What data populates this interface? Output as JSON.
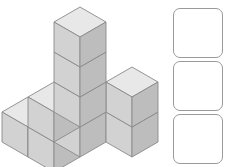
{
  "figure": {
    "name": "isometric-cube-stack",
    "cube_count": 9,
    "colors": {
      "top_face": "#e8e8e8",
      "left_face": "#d2d2d2",
      "right_face": "#bdbdbd",
      "outline": "#8a8a8a",
      "background": "#ffffff"
    },
    "projection": {
      "half_width": 26,
      "half_height": 15,
      "cube_height": 30,
      "origin_x": 80,
      "origin_y": 127
    },
    "cubes": [
      {
        "label": "bottom-left-back",
        "gx": -1,
        "gy": 1,
        "gz": 0
      },
      {
        "label": "bottom-left-front",
        "gx": -1,
        "gy": 0,
        "gz": 0
      },
      {
        "label": "bottom-center-back",
        "gx": 0,
        "gy": 1,
        "gz": 0
      },
      {
        "label": "bottom-center-front",
        "gx": 0,
        "gy": 0,
        "gz": 0
      },
      {
        "label": "bottom-right-back",
        "gx": 1,
        "gy": 1,
        "gz": 0
      },
      {
        "label": "bottom-right-front",
        "gx": 1,
        "gy": 0,
        "gz": 0
      },
      {
        "label": "middle-center",
        "gx": 0,
        "gy": 1,
        "gz": 1
      },
      {
        "label": "middle-right",
        "gx": 1,
        "gy": 1,
        "gz": 1
      },
      {
        "label": "top-center",
        "gx": 0,
        "gy": 1,
        "gz": 2
      }
    ]
  },
  "options": {
    "label": "answer-choices",
    "count": 3,
    "boxes": [
      {
        "index": 1,
        "content": ""
      },
      {
        "index": 2,
        "content": ""
      },
      {
        "index": 3,
        "content": ""
      }
    ],
    "box_style": {
      "fill": "#ffffff",
      "stroke": "#9a9a9a",
      "corner_radius": 7
    }
  }
}
